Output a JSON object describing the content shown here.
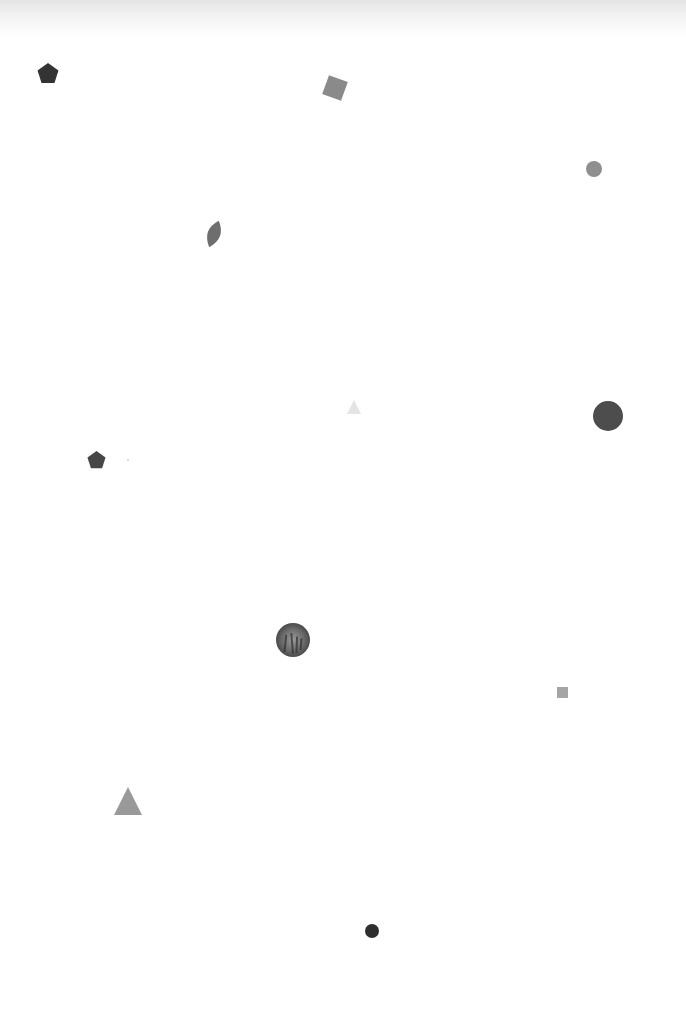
{
  "canvas": {
    "width": 686,
    "height": 1025,
    "background": "#ffffff",
    "top_shade": true
  },
  "shapes": [
    {
      "id": "pentagon-1",
      "type": "pentagon",
      "cx": 48,
      "cy": 74,
      "size": 22,
      "rotation": 0,
      "color": "#333333"
    },
    {
      "id": "square-1",
      "type": "square",
      "cx": 335,
      "cy": 88,
      "size": 20,
      "rotation": 20,
      "color": "#8a8a8a"
    },
    {
      "id": "circle-1",
      "type": "circle",
      "cx": 594,
      "cy": 169,
      "size": 16,
      "rotation": 0,
      "color": "#8f8f8f"
    },
    {
      "id": "leaf-1",
      "type": "leaf",
      "cx": 214,
      "cy": 234,
      "size": 28,
      "rotation": 20,
      "color": "#6e6e6e"
    },
    {
      "id": "triangle-1",
      "type": "triangle",
      "cx": 354,
      "cy": 407,
      "size": 14,
      "rotation": 0,
      "color": "#e4e4e4"
    },
    {
      "id": "circle-2",
      "type": "circle",
      "cx": 608,
      "cy": 416,
      "size": 30,
      "rotation": 0,
      "color": "#4d4d4d"
    },
    {
      "id": "pentagon-2",
      "type": "pentagon",
      "cx": 96,
      "cy": 460,
      "size": 19,
      "rotation": 0,
      "color": "#464646"
    },
    {
      "id": "dot-1",
      "type": "circle",
      "cx": 128,
      "cy": 460,
      "size": 2,
      "rotation": 0,
      "color": "#cfcfcf"
    },
    {
      "id": "photo-circle-1",
      "type": "textured-circle",
      "cx": 293,
      "cy": 640,
      "size": 34,
      "rotation": 0,
      "color": "#7a7a7a"
    },
    {
      "id": "square-2",
      "type": "square",
      "cx": 562,
      "cy": 692,
      "size": 11,
      "rotation": 0,
      "color": "#a5a5a5"
    },
    {
      "id": "triangle-2",
      "type": "triangle",
      "cx": 128,
      "cy": 801,
      "size": 28,
      "rotation": 0,
      "color": "#999999"
    },
    {
      "id": "circle-3",
      "type": "circle",
      "cx": 372,
      "cy": 931,
      "size": 14,
      "rotation": 0,
      "color": "#2e2e2e"
    }
  ]
}
